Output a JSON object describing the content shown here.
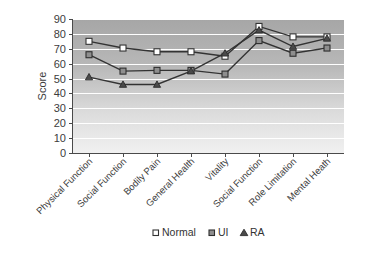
{
  "chart_data": {
    "type": "line",
    "title": "",
    "subtitle": "",
    "xlabel": "",
    "ylabel": "Score",
    "ylim": [
      0,
      90
    ],
    "ytick_step": 10,
    "yticks": [
      0,
      10,
      20,
      30,
      40,
      50,
      60,
      70,
      80,
      90
    ],
    "grid": true,
    "grid_axis": "y",
    "legend_position": "bottom",
    "categories": [
      "Physical Function",
      "Social Function",
      "Bodily Pain",
      "General Health",
      "Vitality",
      "Social Function",
      "Role Limitation",
      "Mental Heath"
    ],
    "series": [
      {
        "name": "Normal",
        "marker": "open-square",
        "color": "#ffffff",
        "values": [
          75,
          70.5,
          68,
          68,
          65,
          85,
          78,
          78
        ]
      },
      {
        "name": "UI",
        "marker": "filled-square",
        "color": "#8e8e8e",
        "values": [
          66,
          55,
          55.5,
          55.5,
          53,
          75.5,
          67,
          70.5
        ]
      },
      {
        "name": "RA",
        "marker": "filled-triangle",
        "color": "#4a4a4a",
        "values": [
          51,
          46,
          46,
          55,
          67,
          82.5,
          71.5,
          77
        ]
      }
    ]
  },
  "legend": {
    "items": [
      {
        "label": "Normal",
        "marker": "open-square"
      },
      {
        "label": "UI",
        "marker": "filled-square"
      },
      {
        "label": "RA",
        "marker": "filled-triangle"
      }
    ]
  },
  "plot_style": {
    "background_top": "#a8a8a8",
    "background_bottom": "#ededed",
    "gridline_color": "#ffffff",
    "axis_color": "#4a4a4a"
  }
}
